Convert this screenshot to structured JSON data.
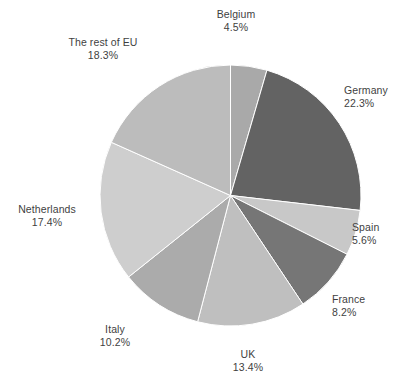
{
  "chart_data": {
    "type": "pie",
    "title": "",
    "subtitle": "",
    "xlabel": "",
    "ylabel": "",
    "legend_position": "none",
    "grid": false,
    "label_format": "name_and_percent",
    "start_angle_deg": 0,
    "direction": "clockwise",
    "categories": [
      "Belgium",
      "Germany",
      "Spain",
      "France",
      "UK",
      "Italy",
      "Netherlands",
      "The rest of EU"
    ],
    "values": [
      4.5,
      22.3,
      5.6,
      8.2,
      13.4,
      10.2,
      17.4,
      18.3
    ],
    "units": "%",
    "slices": [
      {
        "label": "Belgium",
        "percent_text": "4.5%",
        "value": 4.5,
        "color": "#a9a9a9"
      },
      {
        "label": "Germany",
        "percent_text": "22.3%",
        "value": 22.3,
        "color": "#636363"
      },
      {
        "label": "Spain",
        "percent_text": "5.6%",
        "value": 5.6,
        "color": "#c8c8c8"
      },
      {
        "label": "France",
        "percent_text": "8.2%",
        "value": 8.2,
        "color": "#767676"
      },
      {
        "label": "UK",
        "percent_text": "13.4%",
        "value": 13.4,
        "color": "#bfbfbf"
      },
      {
        "label": "Italy",
        "percent_text": "10.2%",
        "value": 10.2,
        "color": "#ababab"
      },
      {
        "label": "Netherlands",
        "percent_text": "17.4%",
        "value": 17.4,
        "color": "#cecece"
      },
      {
        "label": "The rest of EU",
        "percent_text": "18.3%",
        "value": 18.3,
        "color": "#bcbcbc"
      }
    ]
  },
  "colors": {
    "background": "#ffffff",
    "label_text": "#3f3f3f",
    "slice_divider": "#ffffff"
  }
}
